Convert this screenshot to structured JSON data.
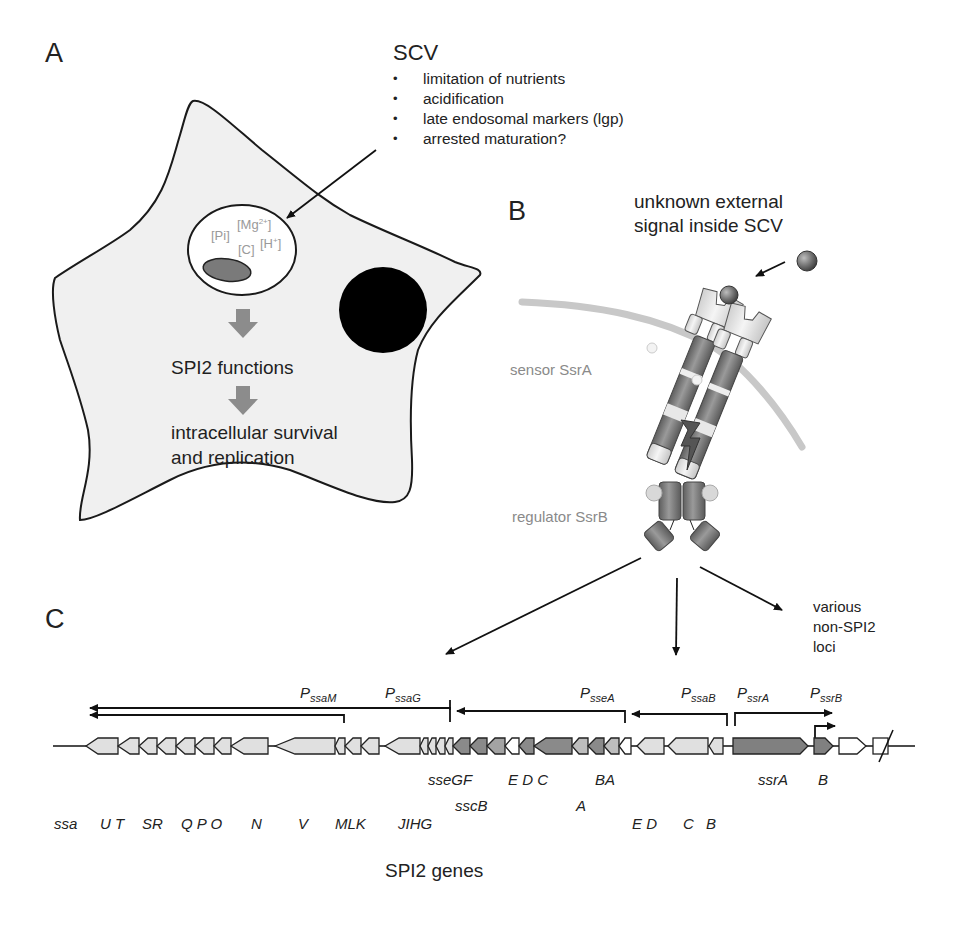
{
  "figure": {
    "panels": {
      "A": {
        "label": "A",
        "scv": {
          "title": "SCV",
          "bullets": [
            "limitation of nutrients",
            "acidification",
            "late endosomal markers (lgp)",
            "arrested maturation?"
          ]
        },
        "vacuole_ions": {
          "pi": "[Pi]",
          "mg": "[Mg",
          "mg_sup": "2+",
          "mg_close": "]",
          "c": "[C]",
          "h": "[H",
          "h_sup": "+",
          "h_close": "]"
        },
        "cascade": {
          "step1": "SPI2 functions",
          "step2_line1": "intracellular survival",
          "step2_line2": "and replication"
        },
        "colors": {
          "cell_fill": "#f0f0f0",
          "nucleus": "#000000",
          "bacterium": "#7a7a7a",
          "arrow_fill": "#8c8c8c"
        }
      },
      "B": {
        "label": "B",
        "signal_line1": "unknown external",
        "signal_line2": "signal inside SCV",
        "sensor_label": "sensor SsrA",
        "regulator_label": "regulator SsrB",
        "phospho_label": "P",
        "targets_line1": "various",
        "targets_line2": "non-SPI2",
        "targets_line3": "loci",
        "colors": {
          "membrane": "#c8c8c8",
          "protein_dark": "#7d7d7d",
          "protein_light": "#e6e6e6",
          "label_grey": "#8a8a8a"
        }
      },
      "C": {
        "label": "C",
        "promoters": [
          {
            "name": "P",
            "sub": "ssaM"
          },
          {
            "name": "P",
            "sub": "ssaG"
          },
          {
            "name": "P",
            "sub": "sseA"
          },
          {
            "name": "P",
            "sub": "ssaB"
          },
          {
            "name": "P",
            "sub": "ssrA"
          },
          {
            "name": "P",
            "sub": "ssrB"
          }
        ],
        "gene_labels_row1": [
          "sseGF",
          "E D C",
          "BA",
          "ssrA",
          "B"
        ],
        "gene_labels_row2": [
          "sscB",
          "A"
        ],
        "gene_labels_row3": [
          "ssa",
          "U T",
          "SR",
          "Q P O",
          "N",
          "V",
          "MLK",
          "JIHG",
          "E D",
          "C",
          "B"
        ],
        "caption": "SPI2 genes",
        "colors": {
          "ssa_genes": "#e0e0e0",
          "sse_genes": "#8a8a8a",
          "ssc_genes": "#bdbdbd",
          "ssr_genes": "#808080",
          "other_genes": "#ffffff"
        }
      }
    }
  }
}
